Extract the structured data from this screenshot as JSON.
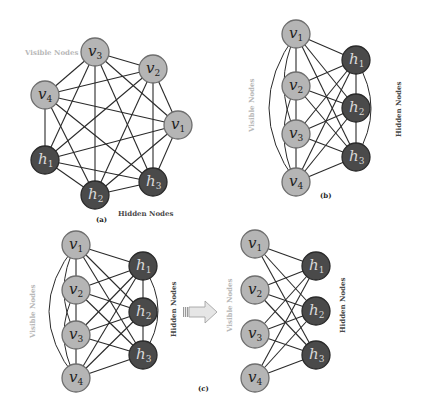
{
  "figure": {
    "panels": [
      {
        "id": "a",
        "caption": "(a)",
        "type": "fully-connected Boltzmann machine",
        "visible_label": "Visible Nodes",
        "hidden_label": "Hidden Nodes",
        "nodes": [
          {
            "id": "v3",
            "base": "v",
            "sub": "3",
            "kind": "visible",
            "x": 95,
            "y": 52
          },
          {
            "id": "v2",
            "base": "v",
            "sub": "2",
            "kind": "visible",
            "x": 153,
            "y": 69
          },
          {
            "id": "v4",
            "base": "v",
            "sub": "4",
            "kind": "visible",
            "x": 45,
            "y": 95
          },
          {
            "id": "v1",
            "base": "v",
            "sub": "1",
            "kind": "visible",
            "x": 178,
            "y": 125
          },
          {
            "id": "h1",
            "base": "h",
            "sub": "1",
            "kind": "hidden",
            "x": 45,
            "y": 160
          },
          {
            "id": "h2",
            "base": "h",
            "sub": "2",
            "kind": "hidden",
            "x": 95,
            "y": 195
          },
          {
            "id": "h3",
            "base": "h",
            "sub": "3",
            "kind": "hidden",
            "x": 153,
            "y": 182
          }
        ]
      },
      {
        "id": "b",
        "caption": "(b)",
        "type": "Boltzmann machine, layered layout",
        "visible_label": "Visible Nodes",
        "hidden_label": "Hidden Nodes",
        "nodes": [
          {
            "id": "v1",
            "base": "v",
            "sub": "1",
            "kind": "visible",
            "x": 296,
            "y": 34
          },
          {
            "id": "v2",
            "base": "v",
            "sub": "2",
            "kind": "visible",
            "x": 296,
            "y": 86
          },
          {
            "id": "v3",
            "base": "v",
            "sub": "3",
            "kind": "visible",
            "x": 296,
            "y": 134
          },
          {
            "id": "v4",
            "base": "v",
            "sub": "4",
            "kind": "visible",
            "x": 296,
            "y": 182
          },
          {
            "id": "h1",
            "base": "h",
            "sub": "1",
            "kind": "hidden",
            "x": 356,
            "y": 60
          },
          {
            "id": "h2",
            "base": "h",
            "sub": "2",
            "kind": "hidden",
            "x": 356,
            "y": 108
          },
          {
            "id": "h3",
            "base": "h",
            "sub": "3",
            "kind": "hidden",
            "x": 356,
            "y": 157
          }
        ]
      },
      {
        "id": "c-left",
        "caption": "(c)",
        "type": "Boltzmann machine (before)",
        "visible_label": "Visible Nodes",
        "hidden_label": "Hidden Nodes",
        "nodes": [
          {
            "id": "v1",
            "base": "v",
            "sub": "1",
            "kind": "visible",
            "x": 76,
            "y": 245
          },
          {
            "id": "v2",
            "base": "v",
            "sub": "2",
            "kind": "visible",
            "x": 76,
            "y": 290
          },
          {
            "id": "v3",
            "base": "v",
            "sub": "3",
            "kind": "visible",
            "x": 76,
            "y": 335
          },
          {
            "id": "v4",
            "base": "v",
            "sub": "4",
            "kind": "visible",
            "x": 76,
            "y": 378
          },
          {
            "id": "h1",
            "base": "h",
            "sub": "1",
            "kind": "hidden",
            "x": 143,
            "y": 266
          },
          {
            "id": "h2",
            "base": "h",
            "sub": "2",
            "kind": "hidden",
            "x": 143,
            "y": 312
          },
          {
            "id": "h3",
            "base": "h",
            "sub": "3",
            "kind": "hidden",
            "x": 143,
            "y": 355
          }
        ]
      },
      {
        "id": "c-right",
        "caption": "",
        "type": "Restricted Boltzmann machine (after)",
        "visible_label": "Visible Nodes",
        "hidden_label": "Hidden Nodes",
        "nodes": [
          {
            "id": "v1",
            "base": "v",
            "sub": "1",
            "kind": "visible",
            "x": 255,
            "y": 244
          },
          {
            "id": "v2",
            "base": "v",
            "sub": "2",
            "kind": "visible",
            "x": 255,
            "y": 290
          },
          {
            "id": "v3",
            "base": "v",
            "sub": "3",
            "kind": "visible",
            "x": 255,
            "y": 334
          },
          {
            "id": "v4",
            "base": "v",
            "sub": "4",
            "kind": "visible",
            "x": 255,
            "y": 378
          },
          {
            "id": "h1",
            "base": "h",
            "sub": "1",
            "kind": "hidden",
            "x": 316,
            "y": 266
          },
          {
            "id": "h2",
            "base": "h",
            "sub": "2",
            "kind": "hidden",
            "x": 316,
            "y": 311
          },
          {
            "id": "h3",
            "base": "h",
            "sub": "3",
            "kind": "hidden",
            "x": 316,
            "y": 355
          }
        ]
      }
    ],
    "arrow": {
      "from_x": 183,
      "to_x": 217,
      "y": 312,
      "fill": "#e6e6e6",
      "stroke": "#9a9a9a"
    },
    "colors": {
      "visible_node_fill": "#b5b5b5",
      "hidden_node_fill": "#4a4a4a",
      "edge": "#2a2a2a",
      "visible_label_text": "#b8b8b8",
      "hidden_label_text": "#4a4a4a"
    },
    "node_radius": 14
  }
}
